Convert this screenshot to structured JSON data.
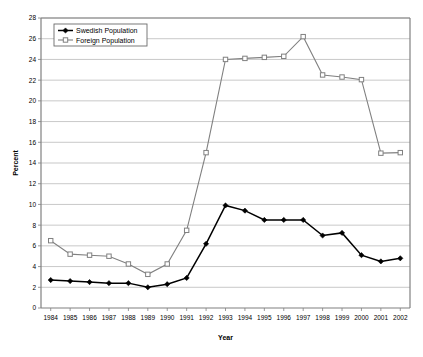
{
  "chart_data": {
    "type": "line",
    "title": "",
    "xlabel": "Year",
    "ylabel": "Percent",
    "ylim": [
      0,
      28
    ],
    "ytick_step": 2,
    "yticks": [
      0,
      2,
      4,
      6,
      8,
      10,
      12,
      14,
      16,
      18,
      20,
      22,
      24,
      26,
      28
    ],
    "grid": "horizontal",
    "legend_position": "top-left",
    "categories": [
      1984,
      1985,
      1986,
      1987,
      1988,
      1989,
      1990,
      1991,
      1992,
      1993,
      1994,
      1995,
      1996,
      1997,
      1998,
      1999,
      2000,
      2001,
      2002
    ],
    "x_tick_labels": [
      "1984",
      "1985",
      "1986",
      "1987",
      "1988",
      "1989",
      "1990",
      "1991",
      "1992",
      "1993",
      "1994",
      "1995",
      "1996",
      "1997",
      "1998",
      "1999",
      "2000",
      "2001",
      "2002"
    ],
    "series": [
      {
        "name": "Swedish Population",
        "color": "#000000",
        "marker": "filled-diamond",
        "values": [
          2.7,
          2.6,
          2.5,
          2.4,
          2.4,
          2.0,
          2.3,
          2.9,
          6.2,
          9.9,
          9.4,
          8.5,
          8.5,
          8.5,
          7.0,
          7.25,
          5.1,
          4.5,
          4.8
        ]
      },
      {
        "name": "Foreign Population",
        "color": "#808080",
        "marker": "open-square",
        "values": [
          6.5,
          5.2,
          5.1,
          5.0,
          4.25,
          3.25,
          4.25,
          7.5,
          15.0,
          24.0,
          24.1,
          24.2,
          24.3,
          26.2,
          22.5,
          22.3,
          22.05,
          14.95,
          15.0
        ]
      }
    ]
  },
  "legend": {
    "items": [
      {
        "label": "Swedish Population"
      },
      {
        "label": "Foreign Population"
      }
    ]
  },
  "colors": {
    "swedish": "#000000",
    "foreign": "#808080",
    "gridline": "#b0b0b0",
    "axis": "#808080",
    "background": "#ffffff"
  }
}
